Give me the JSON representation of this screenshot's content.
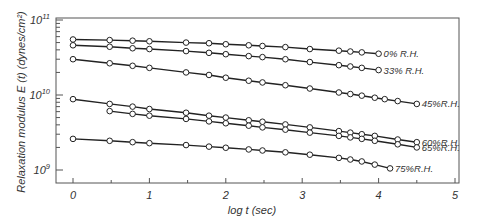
{
  "chart_data": {
    "type": "line",
    "title": "",
    "xlabel": "log t (sec)",
    "ylabel": "Relaxation modulus E (t) (dynes/cm²)",
    "yscale": "log",
    "xlim": [
      -0.25,
      5
    ],
    "ylim": [
      1000000000.0,
      100000000000.0
    ],
    "xticks": [
      0,
      1,
      2,
      3,
      4,
      5
    ],
    "xtick_labels": [
      "0",
      "1",
      "2",
      "3",
      "4",
      "5"
    ],
    "yticks": [
      1000000000.0,
      10000000000.0,
      100000000000.0
    ],
    "ytick_labels": [
      {
        "base": "10",
        "exp": "9"
      },
      {
        "base": "10",
        "exp": "10"
      },
      {
        "base": "10",
        "exp": "11"
      }
    ],
    "grid": false,
    "legend": "inline labels at line ends",
    "marker": "open-circle",
    "series": [
      {
        "name": "0% R.H.",
        "x": [
          0,
          0.48,
          0.78,
          1.0,
          1.48,
          1.78,
          2.0,
          2.3,
          2.48,
          2.78,
          3.1,
          3.48,
          3.63,
          3.78,
          4.0
        ],
        "y": [
          55000000000.0,
          54000000000.0,
          53000000000.0,
          52000000000.0,
          50000000000.0,
          49000000000.0,
          47500000000.0,
          46000000000.0,
          45000000000.0,
          43500000000.0,
          41000000000.0,
          39000000000.0,
          38000000000.0,
          37000000000.0,
          35500000000.0
        ]
      },
      {
        "name": "33% R.H.",
        "x": [
          0,
          0.48,
          0.78,
          1.0,
          1.48,
          1.78,
          2.0,
          2.3,
          2.48,
          2.78,
          3.1,
          3.48,
          3.63,
          3.78,
          4.0
        ],
        "y": [
          46000000000.0,
          44000000000.0,
          42000000000.0,
          41000000000.0,
          38500000000.0,
          36500000000.0,
          35000000000.0,
          33000000000.0,
          32000000000.0,
          30000000000.0,
          27500000000.0,
          25000000000.0,
          24000000000.0,
          23000000000.0,
          21500000000.0
        ]
      },
      {
        "name": "45%R.H.",
        "x": [
          0,
          0.48,
          0.78,
          1.0,
          1.48,
          1.78,
          2.0,
          2.3,
          2.48,
          2.78,
          3.1,
          3.48,
          3.63,
          3.78,
          3.95,
          4.08,
          4.25,
          4.5
        ],
        "y": [
          30000000000.0,
          26500000000.0,
          24500000000.0,
          23000000000.0,
          20000000000.0,
          18500000000.0,
          17000000000.0,
          15500000000.0,
          14700000000.0,
          13500000000.0,
          12200000000.0,
          10800000000.0,
          10300000000.0,
          9800000000.0,
          9200000000.0,
          8800000000.0,
          8300000000.0,
          7600000000.0
        ]
      },
      {
        "name": "60%R.H.",
        "x": [
          0,
          0.48,
          0.78,
          1.0,
          1.48,
          1.78,
          2.0,
          2.3,
          2.48,
          2.78,
          3.1,
          3.48,
          3.63,
          3.78,
          3.95,
          4.25,
          4.5
        ],
        "y": [
          8800000000.0,
          7600000000.0,
          7000000000.0,
          6500000000.0,
          5800000000.0,
          5300000000.0,
          5000000000.0,
          4600000000.0,
          4400000000.0,
          4050000000.0,
          3700000000.0,
          3300000000.0,
          3150000000.0,
          3000000000.0,
          2850000000.0,
          2550000000.0,
          2350000000.0
        ]
      },
      {
        "name": "65%R.H.",
        "x": [
          0.48,
          0.78,
          1.0,
          1.48,
          1.78,
          2.0,
          2.3,
          2.48,
          2.78,
          3.1,
          3.48,
          3.63,
          3.78,
          3.95,
          4.25,
          4.5
        ],
        "y": [
          6100000000.0,
          5600000000.0,
          5300000000.0,
          4800000000.0,
          4450000000.0,
          4200000000.0,
          3900000000.0,
          3700000000.0,
          3450000000.0,
          3150000000.0,
          2850000000.0,
          2720000000.0,
          2600000000.0,
          2450000000.0,
          2200000000.0,
          2000000000.0
        ]
      },
      {
        "name": "75%R.H.",
        "x": [
          0,
          0.48,
          0.78,
          1.0,
          1.48,
          1.78,
          2.0,
          2.3,
          2.48,
          2.78,
          3.1,
          3.48,
          3.63,
          3.78,
          3.95,
          4.15
        ],
        "y": [
          2600000000.0,
          2450000000.0,
          2350000000.0,
          2280000000.0,
          2150000000.0,
          2050000000.0,
          1980000000.0,
          1880000000.0,
          1820000000.0,
          1720000000.0,
          1600000000.0,
          1450000000.0,
          1380000000.0,
          1300000000.0,
          1180000000.0,
          1050000000.0
        ]
      }
    ]
  }
}
